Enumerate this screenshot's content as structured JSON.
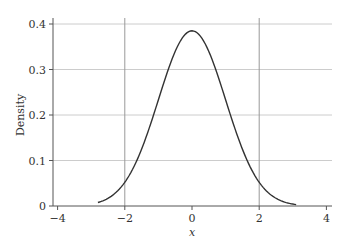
{
  "chart_data": {
    "type": "line",
    "title": "",
    "xlabel": "x",
    "ylabel": "Density",
    "xlim": [
      -4,
      4
    ],
    "ylim": [
      0,
      0.4
    ],
    "x_ticks": [
      -4,
      -2,
      0,
      2,
      4
    ],
    "x_tick_labels": [
      "−4",
      "−2",
      "0",
      "2",
      "4"
    ],
    "y_ticks": [
      0,
      0.1,
      0.2,
      0.3,
      0.4
    ],
    "y_tick_labels": [
      "0",
      "0.1",
      "0.2",
      "0.3",
      "0.4"
    ],
    "grid": {
      "horizontal": true,
      "vertical_lines_at": [
        -2,
        2
      ]
    },
    "series": [
      {
        "name": "density",
        "description": "Standard-normal-like bell curve, peak ~0.385 at x=0, drawn from x≈-2.8 to x≈3.1",
        "x": [
          -2.8,
          -2.5,
          -2.0,
          -1.5,
          -1.0,
          -0.5,
          0,
          0.5,
          1.0,
          1.5,
          2.0,
          2.5,
          3.1
        ],
        "y": [
          0.008,
          0.018,
          0.054,
          0.13,
          0.242,
          0.352,
          0.385,
          0.352,
          0.242,
          0.13,
          0.054,
          0.018,
          0.004
        ]
      }
    ],
    "legend": null
  },
  "colors": {
    "curve": "#333333",
    "axis": "#555555",
    "grid": "#cccccc",
    "vline": "#999999"
  }
}
